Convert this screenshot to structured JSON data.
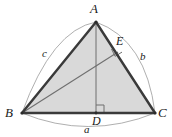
{
  "figure": {
    "background_color": "#ffffff",
    "fill_color": "#d9d9d9",
    "edge_color": "#3a3a3a",
    "arc_color": "#9a9a9a",
    "cevian_color": "#6f6f6f",
    "altitude_color": "#6f6f6f",
    "label_color": "#1a1a1a"
  },
  "vertices": {
    "A": {
      "label": "A",
      "x": 96,
      "y": 22,
      "label_x": 92,
      "label_y": 2
    },
    "B": {
      "label": "B",
      "x": 22,
      "y": 113,
      "label_x": 6,
      "label_y": 109
    },
    "C": {
      "label": "C",
      "x": 155,
      "y": 113,
      "label_x": 159,
      "label_y": 109
    }
  },
  "points": {
    "D": {
      "label": "D",
      "x": 96,
      "y": 113,
      "label_x": 92,
      "label_y": 116
    },
    "E": {
      "label": "E",
      "x": 118,
      "y": 52,
      "label_x": 118,
      "label_y": 36
    }
  },
  "side_labels": {
    "a": {
      "label": "a",
      "x": 85,
      "y": 126
    },
    "b": {
      "label": "b",
      "x": 141,
      "y": 52
    },
    "c": {
      "label": "c",
      "x": 43,
      "y": 49
    }
  },
  "segments": [
    {
      "name": "side-AB",
      "from": "A",
      "to": "B",
      "style": "thick-dark"
    },
    {
      "name": "side-BC",
      "from": "B",
      "to": "C",
      "style": "thick-dark"
    },
    {
      "name": "side-CA",
      "from": "C",
      "to": "A",
      "style": "thick-dark"
    },
    {
      "name": "altitude-AD",
      "from": "A",
      "to": "D",
      "style": "thin-gray"
    },
    {
      "name": "cevian-BE",
      "from": "B",
      "to": "E",
      "style": "thin-gray"
    }
  ],
  "right_angles": [
    {
      "name": "right-angle-at-D",
      "at": "D",
      "size": 8
    },
    {
      "name": "right-angle-at-E",
      "at": "E",
      "size": 8
    }
  ],
  "arcs": [
    {
      "name": "arc-a",
      "label": "a",
      "spans": "B to C",
      "side": "below"
    },
    {
      "name": "arc-b",
      "label": "b",
      "spans": "A to C",
      "side": "outside"
    },
    {
      "name": "arc-c",
      "label": "c",
      "spans": "B to A",
      "side": "outside"
    }
  ]
}
